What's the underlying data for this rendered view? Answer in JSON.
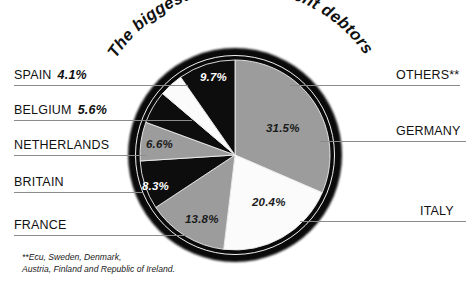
{
  "title": "The biggest EU government debtors",
  "footnote": "**Ecu, Sweden, Denmark,\nAustria, Finland and Republic of Ireland.",
  "labels": {
    "spain": "SPAIN",
    "belgium": "BELGIUM",
    "netherlands": "NETHERLANDS",
    "britain": "BRITAIN",
    "france": "FRANCE",
    "others": "OTHERS**",
    "germany": "GERMANY",
    "italy": "ITALY"
  },
  "values": {
    "spain": "4.1%",
    "belgium": "5.6%",
    "netherlands": "6.6%",
    "britain": "8.3%",
    "france": "13.8%",
    "others": "9.7%",
    "germany": "31.5%",
    "italy": "20.4%"
  },
  "colors": {
    "gray": "#9c9c9c",
    "black": "#0d0d0d",
    "white": "#fbfbfb",
    "leader": "#8b8b8b",
    "text": "#111111"
  },
  "chart_data": {
    "type": "pie",
    "title": "The biggest EU government debtors",
    "note": "**Ecu, Sweden, Denmark, Austria, Finland and Republic of Ireland.",
    "start_angle_deg": 0,
    "direction": "clockwise",
    "categories": [
      "GERMANY",
      "ITALY",
      "FRANCE",
      "BRITAIN",
      "NETHERLANDS",
      "BELGIUM",
      "SPAIN",
      "OTHERS**"
    ],
    "values": [
      31.5,
      20.4,
      13.8,
      8.3,
      6.6,
      5.6,
      4.1,
      9.7
    ],
    "unit": "percent",
    "total": 100.0,
    "slice_fills": [
      "gray",
      "white",
      "gray",
      "black",
      "gray",
      "black",
      "white",
      "black"
    ],
    "slices": [
      {
        "name": "GERMANY",
        "value": 31.5,
        "label": "31.5%",
        "fill": "#9c9c9c",
        "text_color": "dark"
      },
      {
        "name": "ITALY",
        "value": 20.4,
        "label": "20.4%",
        "fill": "#fbfbfb",
        "text_color": "dark"
      },
      {
        "name": "FRANCE",
        "value": 13.8,
        "label": "13.8%",
        "fill": "#9c9c9c",
        "text_color": "dark"
      },
      {
        "name": "BRITAIN",
        "value": 8.3,
        "label": "8.3%",
        "fill": "#0d0d0d",
        "text_color": "light"
      },
      {
        "name": "NETHERLANDS",
        "value": 6.6,
        "label": "6.6%",
        "fill": "#9c9c9c",
        "text_color": "dark"
      },
      {
        "name": "BELGIUM",
        "value": 5.6,
        "label": "5.6%",
        "fill": "#0d0d0d",
        "text_color": "light"
      },
      {
        "name": "SPAIN",
        "value": 4.1,
        "label": "4.1%",
        "fill": "#fbfbfb",
        "text_color": "dark"
      },
      {
        "name": "OTHERS**",
        "value": 9.7,
        "label": "9.7%",
        "fill": "#0d0d0d",
        "text_color": "light"
      }
    ],
    "legend": "callout labels with leader lines, left and right of pie"
  }
}
